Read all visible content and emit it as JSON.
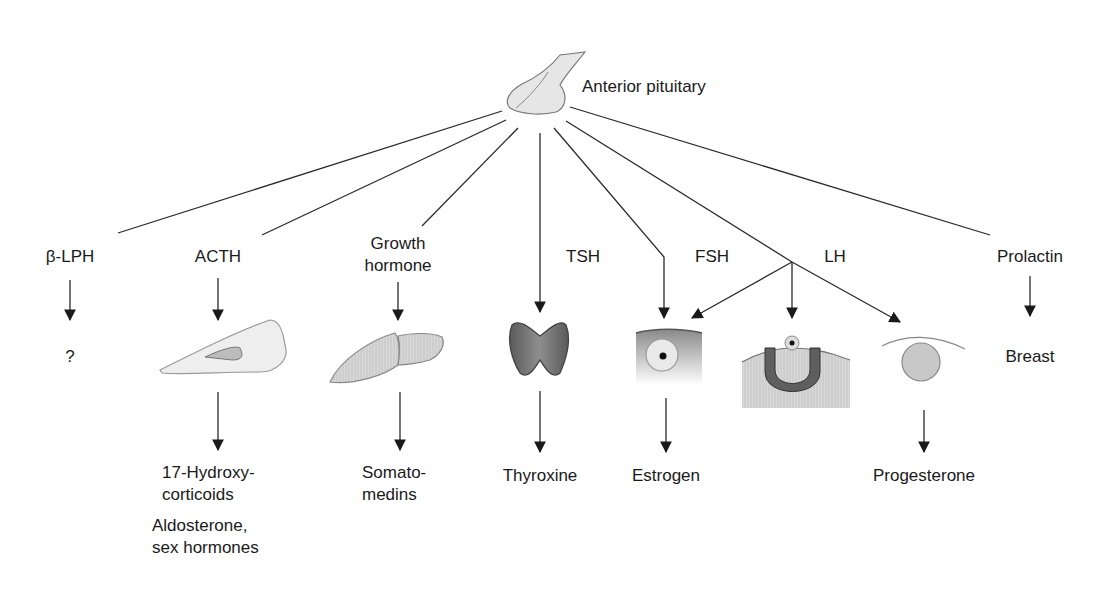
{
  "diagram": {
    "title": "Anterior pituitary",
    "hormones": [
      {
        "id": "blph",
        "label": "β-LPH",
        "target": "?",
        "products": []
      },
      {
        "id": "acth",
        "label": "ACTH",
        "target": "Adrenal cortex cell",
        "products": [
          "17-Hydroxy-corticoids",
          "Aldosterone, sex hormones"
        ]
      },
      {
        "id": "gh",
        "label": "Growth hormone",
        "target": "Liver",
        "products": [
          "Somato-medins"
        ]
      },
      {
        "id": "tsh",
        "label": "TSH",
        "target": "Thyroid",
        "products": [
          "Thyroxine"
        ]
      },
      {
        "id": "fsh",
        "label": "FSH",
        "target": "Ovarian follicle",
        "products": [
          "Estrogen"
        ]
      },
      {
        "id": "lh",
        "label": "LH",
        "target": "Ovulation / Corpus luteum",
        "products": [
          "Progesterone"
        ]
      },
      {
        "id": "prl",
        "label": "Prolactin",
        "target": "Breast",
        "products": []
      }
    ]
  },
  "labels": {
    "source": "Anterior pituitary",
    "blph": "β-LPH",
    "blph_target": "?",
    "acth": "ACTH",
    "gh_line1": "Growth",
    "gh_line2": "hormone",
    "tsh": "TSH",
    "fsh": "FSH",
    "lh": "LH",
    "prolactin": "Prolactin",
    "breast": "Breast",
    "acth_prod1_l1": "17-Hydroxy-",
    "acth_prod1_l2": "corticoids",
    "acth_prod2_l1": "Aldosterone,",
    "acth_prod2_l2": "sex hormones",
    "gh_prod_l1": "Somato-",
    "gh_prod_l2": "medins",
    "tsh_prod": "Thyroxine",
    "fsh_prod": "Estrogen",
    "lh_prod": "Progesterone"
  },
  "colors": {
    "line": "#2a2a2a",
    "organ_light": "#e4e4e4",
    "organ_mid": "#bdbdbd",
    "organ_dark": "#6a6a6a"
  }
}
